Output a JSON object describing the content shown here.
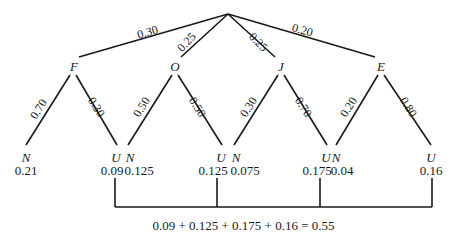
{
  "root": {
    "x": 228,
    "y": 14
  },
  "level1": [
    {
      "name": "F",
      "prob": "0.30"
    },
    {
      "name": "O",
      "prob": "0.25"
    },
    {
      "name": "J",
      "prob": "0.25"
    },
    {
      "name": "E",
      "prob": "0.20"
    }
  ],
  "branches": {
    "F": {
      "N_prob": "0.70",
      "U_prob": "0.30"
    },
    "O": {
      "N_prob": "0.50",
      "U_prob": "0.50"
    },
    "J": {
      "N_prob": "0.30",
      "U_prob": "0.70"
    },
    "E": {
      "N_prob": "0.20",
      "U_prob": "0.80"
    }
  },
  "leaves": [
    {
      "letter": "N",
      "value": "0.21"
    },
    {
      "letter": "U",
      "value": "0.09"
    },
    {
      "letter": "N",
      "value": "0.125"
    },
    {
      "letter": "U",
      "value": "0.125"
    },
    {
      "letter": "N",
      "value": "0.075"
    },
    {
      "letter": "U",
      "value": "0.175"
    },
    {
      "letter": "N",
      "value": "0.04"
    },
    {
      "letter": "U",
      "value": "0.16"
    }
  ],
  "equation": "0.09 + 0.125 + 0.175 + 0.16 = 0.55",
  "colors": {
    "line": "#1a1a1a",
    "background": "#ffffff"
  }
}
